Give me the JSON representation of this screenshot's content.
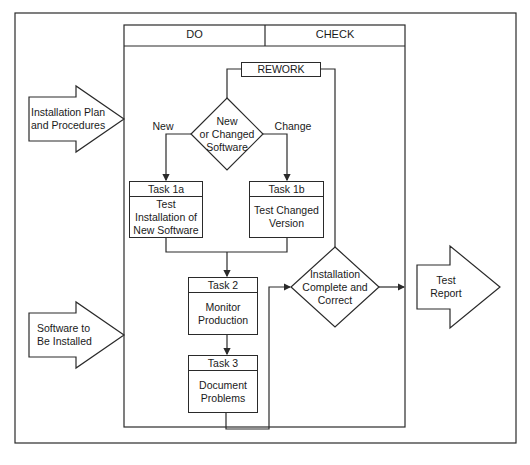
{
  "diagram": {
    "columns": {
      "do": "DO",
      "check": "CHECK"
    },
    "rework": "REWORK",
    "decision_software": "New\nor Changed\nSoftware",
    "branch_new": "New",
    "branch_change": "Change",
    "task1a": {
      "title": "Task 1a",
      "body": "Test\nInstallation of\nNew Software"
    },
    "task1b": {
      "title": "Task 1b",
      "body": "Test Changed\nVersion"
    },
    "task2": {
      "title": "Task 2",
      "body": "Monitor\nProduction"
    },
    "task3": {
      "title": "Task 3",
      "body": "Document\nProblems"
    },
    "decision_check": "Installation\nComplete and\nCorrect",
    "inputs": [
      {
        "label": "Installation Plan\nand Procedures"
      },
      {
        "label": "Software to\nBe Installed"
      }
    ],
    "output": {
      "label": "Test\nReport"
    },
    "colors": {
      "line": "#2a2a2a",
      "background": "#ffffff"
    }
  }
}
